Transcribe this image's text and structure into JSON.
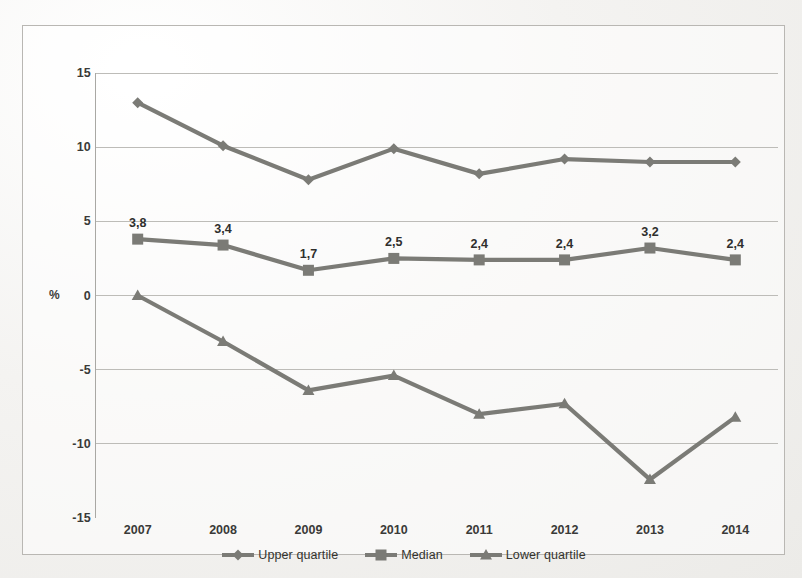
{
  "chart_data": {
    "type": "line",
    "title": "",
    "xlabel": "",
    "ylabel": "%",
    "categories": [
      "2007",
      "2008",
      "2009",
      "2010",
      "2011",
      "2012",
      "2013",
      "2014"
    ],
    "ylim": [
      -15,
      15
    ],
    "yticks": [
      "15",
      "10",
      "5",
      "0",
      "-5",
      "-10",
      "-15"
    ],
    "ytick_values": [
      15,
      10,
      5,
      0,
      -5,
      -10,
      -15
    ],
    "grid": true,
    "legend_position": "bottom",
    "series": [
      {
        "name": "Upper quartile",
        "marker": "diamond",
        "color": "#7b7b76",
        "values": [
          13.0,
          10.1,
          7.8,
          9.9,
          8.2,
          9.2,
          9.0,
          9.0
        ],
        "labels": [
          "",
          "",
          "",
          "",
          "",
          "",
          "",
          ""
        ]
      },
      {
        "name": "Median",
        "marker": "square",
        "color": "#7b7b76",
        "values": [
          3.8,
          3.4,
          1.7,
          2.5,
          2.4,
          2.4,
          3.2,
          2.4
        ],
        "labels": [
          "3,8",
          "3,4",
          "1,7",
          "2,5",
          "2,4",
          "2,4",
          "3,2",
          "2,4"
        ]
      },
      {
        "name": "Lower quartile",
        "marker": "triangle",
        "color": "#7b7b76",
        "values": [
          0.0,
          -3.1,
          -6.4,
          -5.4,
          -8.0,
          -7.3,
          -12.4,
          -8.2
        ],
        "labels": [
          "",
          "",
          "",
          "",
          "",
          "",
          "",
          ""
        ]
      }
    ]
  },
  "colors": {
    "line": "#7b7b76",
    "grid": "#bdbcb8",
    "axis": "#a9a8a4",
    "text": "#34342f",
    "frame": "#b9b7b3",
    "page": "#f2f1ef"
  },
  "legend": {
    "items": [
      {
        "label": "Upper quartile",
        "marker": "diamond"
      },
      {
        "label": "Median",
        "marker": "square"
      },
      {
        "label": "Lower quartile",
        "marker": "triangle"
      }
    ]
  }
}
